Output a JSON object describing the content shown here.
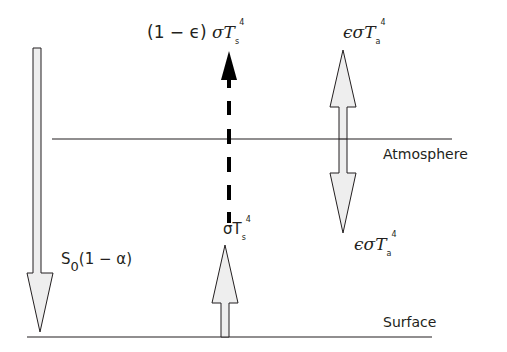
{
  "diagram": {
    "type": "energy-balance",
    "layers": {
      "atmosphere": {
        "label": "Atmosphere"
      },
      "surface": {
        "label": "Surface"
      }
    },
    "labels": {
      "solar_in": {
        "base": "S",
        "sub": "0",
        "rest": "(1 − α)"
      },
      "transmitted": {
        "prefix": "(1 − ϵ) ",
        "sym": "σT",
        "sub": "s",
        "sup": "4"
      },
      "atm_up": {
        "sym": "ϵσT",
        "sub": "a",
        "sup": "4"
      },
      "atm_down": {
        "sym": "ϵσT",
        "sub": "a",
        "sup": "4"
      },
      "surface_emission": {
        "sym": "σT",
        "sub": "s",
        "sup": "4"
      }
    },
    "arrows": [
      {
        "id": "solar-incoming",
        "direction": "down",
        "style": "hollow-gray"
      },
      {
        "id": "transmitted-surface-radiation",
        "direction": "up",
        "style": "dashed-black"
      },
      {
        "id": "atmospheric-emission",
        "direction": "up-and-down",
        "style": "hollow-gray"
      },
      {
        "id": "surface-emission",
        "direction": "up",
        "style": "hollow-gray"
      }
    ],
    "colors": {
      "stroke": "#231f20",
      "fill": "#eeeeee"
    }
  }
}
